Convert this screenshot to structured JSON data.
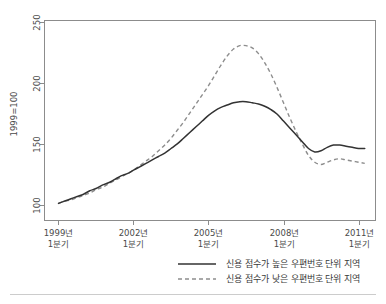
{
  "chart_data": {
    "type": "line",
    "title": "",
    "xlabel": "",
    "ylabel": "1999=100",
    "ylim": [
      85,
      260
    ],
    "yticks": [
      100,
      150,
      200,
      250
    ],
    "ytick_labels": [
      "100",
      "150",
      "200",
      "250"
    ],
    "grid": false,
    "legend_position": "bottom",
    "x": [
      "1999 Q1",
      "1999 Q2",
      "1999 Q3",
      "1999 Q4",
      "2000 Q1",
      "2000 Q2",
      "2000 Q3",
      "2000 Q4",
      "2001 Q1",
      "2001 Q2",
      "2001 Q3",
      "2001 Q4",
      "2002 Q1",
      "2002 Q2",
      "2002 Q3",
      "2002 Q4",
      "2003 Q1",
      "2003 Q2",
      "2003 Q3",
      "2003 Q4",
      "2004 Q1",
      "2004 Q2",
      "2004 Q3",
      "2004 Q4",
      "2005 Q1",
      "2005 Q2",
      "2005 Q3",
      "2005 Q4",
      "2006 Q1",
      "2006 Q2",
      "2006 Q3",
      "2006 Q4",
      "2007 Q1",
      "2007 Q2",
      "2007 Q3",
      "2007 Q4",
      "2008 Q1",
      "2008 Q2",
      "2008 Q3",
      "2008 Q4",
      "2009 Q1",
      "2009 Q2",
      "2009 Q3",
      "2009 Q4",
      "2010 Q1",
      "2010 Q2",
      "2010 Q3",
      "2010 Q4",
      "2011 Q1",
      "2011 Q2"
    ],
    "xticks": [
      "1999 Q1",
      "2002 Q1",
      "2005 Q1",
      "2008 Q1",
      "2011 Q1"
    ],
    "xtick_labels": [
      "1999년\n1분기",
      "2002년\n1분기",
      "2005년\n1분기",
      "2008년\n1분기",
      "2011년\n1분기"
    ],
    "series": [
      {
        "name": "신용 점수가 높은 우편번호 단위 지역",
        "style": "solid",
        "color": "#333333",
        "values": [
          100,
          102,
          104,
          106,
          108,
          111,
          113,
          116,
          118,
          121,
          124,
          126,
          129,
          132,
          135,
          138,
          141,
          144,
          148,
          152,
          157,
          162,
          167,
          172,
          177,
          181,
          184,
          186,
          188,
          189,
          189,
          188,
          187,
          185,
          182,
          178,
          172,
          166,
          160,
          154,
          148,
          145,
          146,
          149,
          151,
          151,
          150,
          149,
          148,
          148
        ]
      },
      {
        "name": "신용 점수가 낮은 우편번호 단위 지역",
        "style": "dashed",
        "color": "#8d8d8d",
        "values": [
          100,
          102,
          103,
          105,
          107,
          109,
          112,
          114,
          117,
          120,
          123,
          126,
          129,
          133,
          137,
          141,
          146,
          151,
          157,
          164,
          171,
          179,
          187,
          195,
          203,
          212,
          221,
          229,
          235,
          238,
          238,
          236,
          231,
          223,
          213,
          201,
          188,
          175,
          163,
          152,
          142,
          136,
          134,
          136,
          138,
          139,
          138,
          137,
          136,
          135
        ]
      }
    ]
  },
  "axes": {
    "y_axis_title": "1999=100"
  },
  "legend": {
    "items": [
      {
        "label": "신용 점수가 높은 우편번호 단위 지역",
        "style": "solid"
      },
      {
        "label": "신용 점수가 낮은 우편번호 단위 지역",
        "style": "dashed"
      }
    ]
  }
}
